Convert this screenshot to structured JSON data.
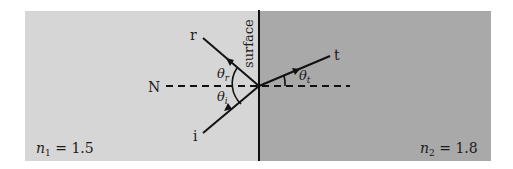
{
  "diagram": {
    "surface_label": "surface",
    "normal_label": "N",
    "rays": {
      "incident": "i",
      "reflected": "r",
      "transmitted": "t"
    },
    "angles": {
      "incident": "θ",
      "incident_sub": "i",
      "reflected": "θ",
      "reflected_sub": "r",
      "transmitted": "θ",
      "transmitted_sub": "t"
    },
    "media": {
      "left": {
        "symbol": "n",
        "sub": "1",
        "equals": " = 1.5",
        "color": "#d6d6d6"
      },
      "right": {
        "symbol": "n",
        "sub": "2",
        "equals": " = 1.8",
        "color": "#a9a9a9"
      }
    },
    "line_color": "#111111"
  }
}
